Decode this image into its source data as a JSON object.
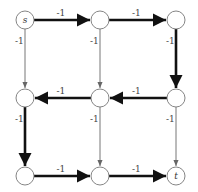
{
  "diagram": {
    "type": "grid-graph",
    "colors": {
      "thick_edge": "#111111",
      "thin_edge": "#666666",
      "node_stroke": "#777777",
      "node_fill": "#ffffff"
    },
    "nodes": [
      {
        "id": "n00",
        "label": "s",
        "x": 25,
        "y": 20
      },
      {
        "id": "n01",
        "label": "",
        "x": 100,
        "y": 20
      },
      {
        "id": "n02",
        "label": "",
        "x": 176,
        "y": 20
      },
      {
        "id": "n10",
        "label": "",
        "x": 25,
        "y": 98
      },
      {
        "id": "n11",
        "label": "",
        "x": 100,
        "y": 98
      },
      {
        "id": "n12",
        "label": "",
        "x": 176,
        "y": 98
      },
      {
        "id": "n20",
        "label": "",
        "x": 25,
        "y": 176
      },
      {
        "id": "n21",
        "label": "",
        "x": 100,
        "y": 176
      },
      {
        "id": "n22",
        "label": "t",
        "x": 176,
        "y": 176
      }
    ],
    "edges": [
      {
        "from": "n00",
        "to": "n01",
        "weight": "-1",
        "thick": true
      },
      {
        "from": "n01",
        "to": "n02",
        "weight": "-1",
        "thick": true
      },
      {
        "from": "n02",
        "to": "n12",
        "weight": "-1",
        "thick": true
      },
      {
        "from": "n12",
        "to": "n11",
        "weight": "-1",
        "thick": true
      },
      {
        "from": "n11",
        "to": "n10",
        "weight": "-1",
        "thick": true
      },
      {
        "from": "n10",
        "to": "n20",
        "weight": "-1",
        "thick": true
      },
      {
        "from": "n20",
        "to": "n21",
        "weight": "-1",
        "thick": true
      },
      {
        "from": "n21",
        "to": "n22",
        "weight": "-1",
        "thick": true
      },
      {
        "from": "n00",
        "to": "n10",
        "weight": "-1",
        "thick": false
      },
      {
        "from": "n01",
        "to": "n11",
        "weight": "-1",
        "thick": false
      },
      {
        "from": "n11",
        "to": "n21",
        "weight": "-1",
        "thick": false
      },
      {
        "from": "n12",
        "to": "n22",
        "weight": "-1",
        "thick": false
      }
    ]
  }
}
